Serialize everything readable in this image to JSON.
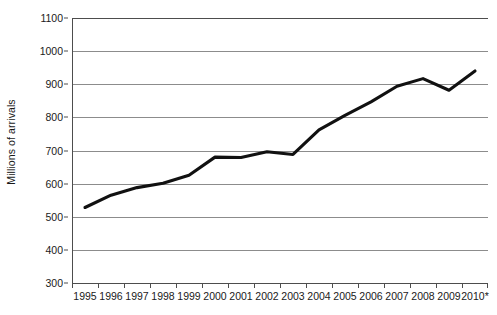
{
  "chart_data": {
    "type": "line",
    "title": "",
    "xlabel": "",
    "ylabel": "Millions of arrivals",
    "ylim": [
      300,
      1100
    ],
    "y_ticks": [
      300,
      400,
      500,
      600,
      700,
      800,
      900,
      1000,
      1100
    ],
    "grid": true,
    "legend": "none",
    "categories": [
      "1995",
      "1996",
      "1997",
      "1998",
      "1999",
      "2000",
      "2001",
      "2002",
      "2003",
      "2004",
      "2005",
      "2006",
      "2007",
      "2008",
      "2009",
      "2010*"
    ],
    "values": [
      528,
      565,
      588,
      601,
      625,
      680,
      679,
      696,
      688,
      762,
      806,
      847,
      894,
      917,
      882,
      940
    ],
    "series": [
      {
        "name": "International tourist arrivals",
        "color": "#111111",
        "values": [
          528,
          565,
          588,
          601,
          625,
          680,
          679,
          696,
          688,
          762,
          806,
          847,
          894,
          917,
          882,
          940
        ]
      }
    ]
  },
  "axes": {
    "y_title": "Millions of arrivals",
    "y_tick_labels": [
      "1100",
      "1000",
      "900",
      "800",
      "700",
      "600",
      "500",
      "400",
      "300"
    ],
    "x_tick_labels": [
      "1995",
      "1996",
      "1997",
      "1998",
      "1999",
      "2000",
      "2001",
      "2002",
      "2003",
      "2004",
      "2005",
      "2006",
      "2007",
      "2008",
      "2009",
      "2010*"
    ]
  },
  "style": {
    "line_color": "#111111",
    "grid_color": "#8c8c8c",
    "axis_color": "#4d4d4d",
    "background": "#ffffff",
    "text_color": "#1a1a1a"
  }
}
